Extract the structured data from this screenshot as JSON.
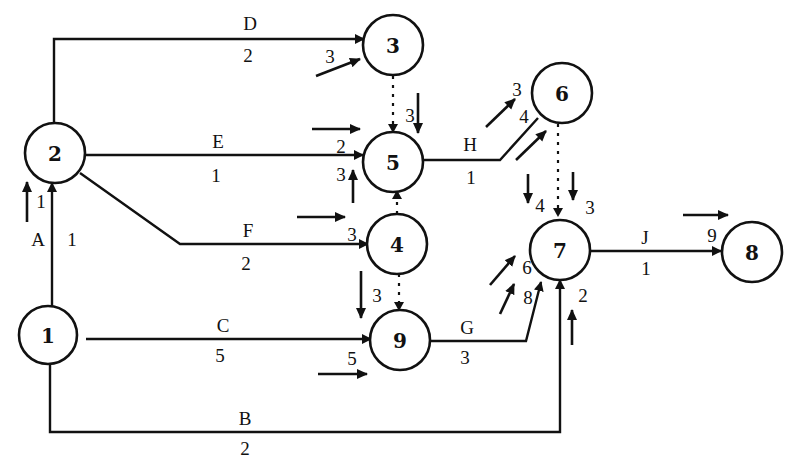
{
  "diagram": {
    "type": "activity-on-arrow network",
    "nodes": [
      {
        "id": "1",
        "label": "1",
        "x": 48,
        "y": 335
      },
      {
        "id": "2",
        "label": "2",
        "x": 55,
        "y": 153
      },
      {
        "id": "3",
        "label": "3",
        "x": 393,
        "y": 45
      },
      {
        "id": "5",
        "label": "5",
        "x": 393,
        "y": 162
      },
      {
        "id": "4",
        "label": "4",
        "x": 397,
        "y": 243
      },
      {
        "id": "9",
        "label": "9",
        "x": 400,
        "y": 340
      },
      {
        "id": "6",
        "label": "6",
        "x": 567,
        "y": 93
      },
      {
        "id": "7",
        "label": "7",
        "x": 560,
        "y": 250
      },
      {
        "id": "8",
        "label": "8",
        "x": 752,
        "y": 252
      }
    ],
    "activities": [
      {
        "name": "A",
        "from": "1",
        "to": "2",
        "duration": "1"
      },
      {
        "name": "B",
        "from": "1",
        "to": "7",
        "duration": "2"
      },
      {
        "name": "C",
        "from": "1",
        "to": "9",
        "duration": "5"
      },
      {
        "name": "D",
        "from": "2",
        "to": "3",
        "duration": "2"
      },
      {
        "name": "E",
        "from": "2",
        "to": "5",
        "duration": "1"
      },
      {
        "name": "F",
        "from": "2",
        "to": "4",
        "duration": "2"
      },
      {
        "name": "G",
        "from": "9",
        "to": "7",
        "duration": "3"
      },
      {
        "name": "H",
        "from": "5",
        "to": "6",
        "duration": "1"
      },
      {
        "name": "J",
        "from": "7",
        "to": "8",
        "duration": "1"
      }
    ],
    "dummies": [
      {
        "from": "3",
        "to": "5"
      },
      {
        "from": "4",
        "to": "5"
      },
      {
        "from": "4",
        "to": "9"
      },
      {
        "from": "6",
        "to": "7"
      }
    ],
    "event_times": {
      "n2_A": "1",
      "n3_D": "3",
      "n5_E": "2",
      "n5_dummy3": "3",
      "n5_dummy4": "3",
      "n4_F": "3",
      "n9_dummy4": "3",
      "n9_C": "5",
      "n6_H_a": "3",
      "n6_H_b": "4",
      "n7_dummy6_a": "4",
      "n7_dummy6_b": "3",
      "n7_G_a": "6",
      "n7_G_b": "8",
      "n7_B": "2",
      "n8_J": "9"
    }
  }
}
